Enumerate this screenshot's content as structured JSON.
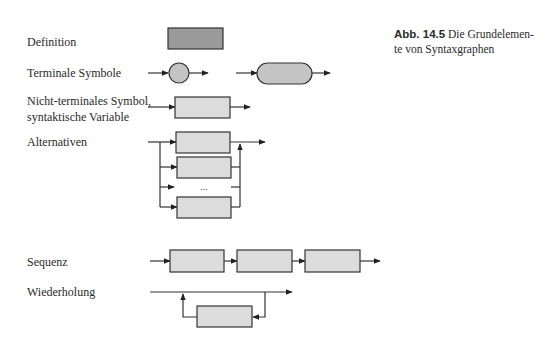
{
  "figure": {
    "caption_label": "Abb. 14.5",
    "caption_text": " Die Grundelemen-te von Syntaxgraphen",
    "caption_line1": " Die Grundelemen-",
    "caption_line2": "te von Syntaxgraphen"
  },
  "rows": [
    {
      "id": "definition",
      "label": "Definition"
    },
    {
      "id": "terminal",
      "label": "Terminale Symbole"
    },
    {
      "id": "nonterminal",
      "label_line1": "Nicht-terminales Symbol,",
      "label_line2": "syntaktische Variable"
    },
    {
      "id": "alternatives",
      "label": "Alternativen",
      "ellipsis": "..."
    },
    {
      "id": "sequence",
      "label": "Sequenz"
    },
    {
      "id": "repetition",
      "label": "Wiederholung"
    }
  ],
  "colors": {
    "definition_fill": "#9a9a9a",
    "terminal_fill": "#c4c4c4",
    "nonterminal_fill": "#dcdcdc",
    "stroke": "#333333"
  }
}
